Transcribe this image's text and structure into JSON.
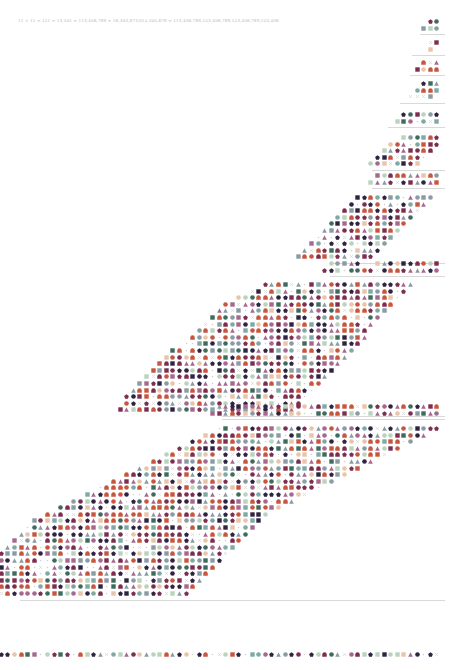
{
  "title": "11 × 11 = 121 = 13,541 = 113,456,789 = 16,343,873,012,345,678 = 113,456,789,123,456,789,123,456,789,123,456",
  "palette": {
    "orange": "#c8553d",
    "green": "#3f6b5c",
    "teal": "#7fa9a6",
    "sage": "#b9d3bc",
    "peach": "#e8c4a8",
    "plum": "#7d2e4f",
    "navy": "#2e2340",
    "mauve": "#a7688f",
    "grey": "#8a9ba3",
    "rule": "#d9d9d9",
    "cross": "#cfcfcf"
  },
  "shapes": [
    "circle",
    "square",
    "triangle",
    "pentagon",
    "arch",
    "cross",
    "dot"
  ],
  "grid": {
    "right_edge": 441,
    "pitch": 6.6,
    "row_pitch": 6.6
  },
  "sections": [
    {
      "rows": [
        [
          0,
          2
        ],
        [
          0,
          3
        ]
      ],
      "top": 19,
      "rule_from": 420,
      "seed": 3
    },
    {
      "rows": [
        [
          0,
          2
        ],
        [
          1,
          2
        ]
      ],
      "top": 40,
      "rule_from": 412,
      "seed": 7
    },
    {
      "rows": [
        [
          0,
          3
        ],
        [
          0,
          4
        ]
      ],
      "top": 60,
      "rule_from": 410,
      "seed": 11
    },
    {
      "rows": [
        [
          0,
          3
        ],
        [
          0,
          4
        ],
        [
          1,
          5
        ]
      ],
      "top": 81,
      "rule_from": 400,
      "seed": 13
    },
    {
      "rows": [
        [
          0,
          6
        ],
        [
          0,
          7
        ]
      ],
      "top": 112,
      "rule_from": 388,
      "seed": 17
    },
    {
      "rows": [
        [
          0,
          6
        ],
        [
          0,
          8
        ],
        [
          1,
          9
        ],
        [
          2,
          10
        ],
        [
          3,
          11
        ]
      ],
      "top": 135,
      "rule_from": 372,
      "seed": 19
    },
    {
      "rows": [
        [
          0,
          10
        ],
        [
          0,
          11
        ]
      ],
      "top": 173,
      "rule_from": 372,
      "seed": 23
    },
    {
      "rows": [
        [
          1,
          13
        ],
        [
          2,
          14
        ],
        [
          3,
          15
        ],
        [
          4,
          16
        ],
        [
          5,
          17
        ],
        [
          6,
          18
        ],
        [
          7,
          19
        ],
        [
          8,
          20
        ],
        [
          9,
          21
        ],
        [
          10,
          22
        ]
      ],
      "top": 195,
      "rule_from": 330,
      "seed": 29
    },
    {
      "rows": [
        [
          0,
          17
        ],
        [
          0,
          18
        ]
      ],
      "top": 261,
      "rule_from": 330,
      "seed": 31
    },
    {
      "rows": [
        [
          4,
          27
        ],
        [
          5,
          29
        ],
        [
          6,
          31
        ],
        [
          7,
          33
        ],
        [
          8,
          34
        ],
        [
          9,
          35
        ],
        [
          10,
          36
        ],
        [
          11,
          37
        ],
        [
          11,
          38
        ],
        [
          12,
          39
        ],
        [
          13,
          41
        ],
        [
          14,
          42
        ],
        [
          15,
          43
        ],
        [
          16,
          44
        ],
        [
          17,
          45
        ],
        [
          18,
          46
        ],
        [
          19,
          47
        ],
        [
          20,
          48
        ],
        [
          21,
          48
        ],
        [
          22,
          49
        ]
      ],
      "top": 282,
      "rule_from": 222,
      "seed": 37
    },
    {
      "rows": [
        [
          0,
          34
        ],
        [
          0,
          35
        ]
      ],
      "top": 404,
      "rule_from": 222,
      "seed": 41
    },
    {
      "rows": [
        [
          0,
          34
        ],
        [
          2,
          36
        ],
        [
          4,
          38
        ],
        [
          6,
          40
        ],
        [
          8,
          42
        ],
        [
          10,
          44
        ],
        [
          12,
          46
        ],
        [
          14,
          48
        ],
        [
          16,
          50
        ],
        [
          18,
          52
        ],
        [
          20,
          54
        ],
        [
          22,
          56
        ],
        [
          24,
          58
        ],
        [
          26,
          60
        ],
        [
          27,
          62
        ],
        [
          28,
          63
        ],
        [
          29,
          64
        ],
        [
          30,
          65
        ],
        [
          31,
          66
        ],
        [
          32,
          67
        ],
        [
          33,
          68
        ],
        [
          34,
          68
        ],
        [
          35,
          68
        ],
        [
          36,
          69
        ],
        [
          37,
          70
        ],
        [
          38,
          70
        ]
      ],
      "top": 426,
      "rule_from": 20,
      "seed": 43
    },
    {
      "rows": [
        [
          0,
          68
        ]
      ],
      "top": 652,
      "rule_from": null,
      "seed": 47
    }
  ],
  "bottom_rule_y": 645
}
